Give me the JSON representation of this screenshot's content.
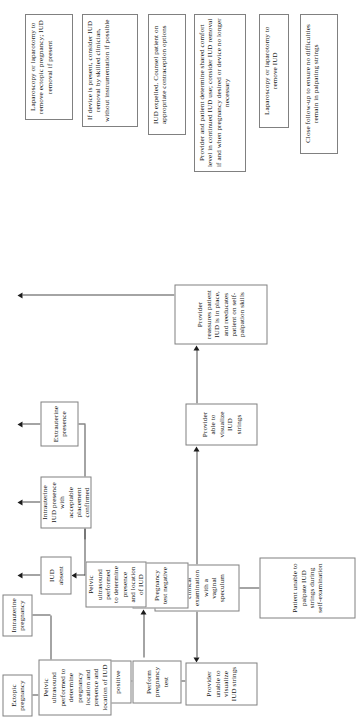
{
  "diagram": {
    "orientation": "rotated-90-ccw",
    "line_color": "#808080",
    "arrow_color": "#1c1c1c",
    "background": "#ffffff",
    "nodes": [
      {
        "id": "patient-unable-palpate",
        "label": "Patient unable to palpate IUD strings during self-examination"
      },
      {
        "id": "provider-clinical-exam",
        "label": "Provider performs a clinical examination with a vaginal speculum"
      },
      {
        "id": "provider-unable-visualize",
        "label": "Provider unable to visualize IUD strings"
      },
      {
        "id": "provider-able-visualize",
        "label": "Provider able to visualize IUD strings"
      },
      {
        "id": "provider-reassures",
        "label": "Provider reassures patient IUD is in place, and reeducates patient on self-palpation skills"
      },
      {
        "id": "perform-pregnancy-test",
        "label": "Perform pregnancy test"
      },
      {
        "id": "pregnancy-test-positive",
        "label": "Pregnancy test positive"
      },
      {
        "id": "pregnancy-test-negative",
        "label": "Pregnancy test negative"
      },
      {
        "id": "pelvic-ultrasound-pregnancy",
        "label": "Pelvic ultrasound performed to determine pregnancy location and presence and location of IUD"
      },
      {
        "id": "pelvic-ultrasound-iud",
        "label": "Pelvic ultrasound performed to determine presence and location of IUD"
      },
      {
        "id": "ectopic-pregnancy",
        "label": "Ectopic pregnancy"
      },
      {
        "id": "intrauterine-pregnancy",
        "label": "Intrauterine pregnancy"
      },
      {
        "id": "laparoscopy-ectopic",
        "label": "Laparoscopy or laparotomy to remove ectopic pregnancy; IUD removal if present"
      },
      {
        "id": "device-present-removal",
        "label": "If device is present, consider IUD removal by skilled clinician, without instrumentation if possible"
      },
      {
        "id": "iud-absent",
        "label": "IUD absent"
      },
      {
        "id": "intrauterine-iud-presence",
        "label": "Intrauterine IUD presence with acceptable placement confirmed"
      },
      {
        "id": "extrauterine-presence",
        "label": "Extrauterine presence"
      },
      {
        "id": "iud-expelled",
        "label": "IUD expelled. Counsel patient on appropriate contraception options"
      },
      {
        "id": "shared-comfort-level",
        "label": "Provider and patient determine shared comfort level in continued IUD use; consider IUD removal if and when pregnancy desired or device no longer necessary"
      },
      {
        "id": "laparoscopy-remove-iud",
        "label": "Laparoscopy or laparotomy to remove IUD"
      },
      {
        "id": "close-follow-up",
        "label": "Close follow-up to ensure no difficulties remain in palpating strings"
      }
    ]
  }
}
